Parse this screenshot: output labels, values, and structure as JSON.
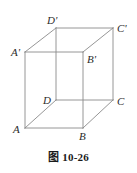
{
  "figure": {
    "type": "geometry-diagram",
    "shape": "cube",
    "caption_label": "图",
    "caption_number": "10-26",
    "caption_full": "图 10-26",
    "line_color": "#8a8a8a",
    "label_color": "#2b2b2b",
    "background_color": "#ffffff",
    "vertices": [
      {
        "id": "A",
        "label": "A",
        "x": 25,
        "y": 128,
        "label_x": 13,
        "label_y": 133
      },
      {
        "id": "B",
        "label": "B",
        "x": 83,
        "y": 128,
        "label_x": 79,
        "label_y": 140
      },
      {
        "id": "C",
        "label": "C",
        "x": 113,
        "y": 100,
        "label_x": 117,
        "label_y": 105
      },
      {
        "id": "D",
        "label": "D",
        "x": 56,
        "y": 100,
        "label_x": 43,
        "label_y": 104
      },
      {
        "id": "A1",
        "label": "A'",
        "x": 25,
        "y": 52,
        "label_x": 11,
        "label_y": 56
      },
      {
        "id": "B1",
        "label": "B'",
        "x": 83,
        "y": 52,
        "label_x": 87,
        "label_y": 63
      },
      {
        "id": "C1",
        "label": "C'",
        "x": 113,
        "y": 28,
        "label_x": 117,
        "label_y": 32
      },
      {
        "id": "D1",
        "label": "D'",
        "x": 56,
        "y": 28,
        "label_x": 47,
        "label_y": 24
      }
    ],
    "edges": [
      {
        "name": "edge-A-B",
        "from": "A",
        "to": "B"
      },
      {
        "name": "edge-B-C",
        "from": "B",
        "to": "C"
      },
      {
        "name": "edge-C-D",
        "from": "C",
        "to": "D"
      },
      {
        "name": "edge-D-A",
        "from": "D",
        "to": "A"
      },
      {
        "name": "edge-A1-B1",
        "from": "A1",
        "to": "B1"
      },
      {
        "name": "edge-B1-C1",
        "from": "B1",
        "to": "C1"
      },
      {
        "name": "edge-C1-D1",
        "from": "C1",
        "to": "D1"
      },
      {
        "name": "edge-D1-A1",
        "from": "D1",
        "to": "A1"
      },
      {
        "name": "edge-A-A1",
        "from": "A",
        "to": "A1"
      },
      {
        "name": "edge-B-B1",
        "from": "B",
        "to": "B1"
      },
      {
        "name": "edge-C-C1",
        "from": "C",
        "to": "C1"
      },
      {
        "name": "edge-D-D1",
        "from": "D",
        "to": "D1"
      }
    ]
  }
}
